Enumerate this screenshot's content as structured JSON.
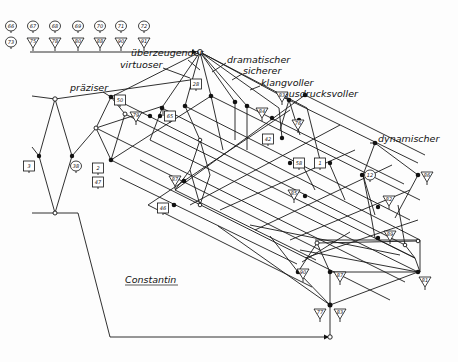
{
  "diagram": {
    "caption": "Constantin",
    "attribute_labels": [
      {
        "text": "überzeugender",
        "x": 131,
        "y": 56
      },
      {
        "text": "virtuoser",
        "x": 120,
        "y": 68
      },
      {
        "text": "präziser",
        "x": 70,
        "y": 91
      },
      {
        "text": "dramatischer",
        "x": 227,
        "y": 63
      },
      {
        "text": "sicherer",
        "x": 243,
        "y": 74
      },
      {
        "text": "klangvoller",
        "x": 261,
        "y": 86
      },
      {
        "text": "ausdrucksvoller",
        "x": 283,
        "y": 97
      },
      {
        "text": "dynamischer",
        "x": 378,
        "y": 142
      }
    ],
    "legend_row_top": [
      "66",
      "67",
      "68",
      "69",
      "70",
      "71",
      "72"
    ],
    "legend_row_bottom": [
      "73",
      "75",
      "78",
      "80",
      "88",
      "90",
      "91"
    ],
    "object_tags": [
      {
        "text": "66",
        "shape": "circle",
        "x": 11,
        "y": 26
      },
      {
        "text": "67",
        "shape": "circle",
        "x": 33,
        "y": 26
      },
      {
        "text": "68",
        "shape": "circle",
        "x": 55,
        "y": 26
      },
      {
        "text": "69",
        "shape": "circle",
        "x": 78,
        "y": 26
      },
      {
        "text": "70",
        "shape": "circle",
        "x": 100,
        "y": 26
      },
      {
        "text": "71",
        "shape": "circle",
        "x": 121,
        "y": 26
      },
      {
        "text": "72",
        "shape": "circle",
        "x": 144,
        "y": 26
      },
      {
        "text": "73",
        "shape": "circle",
        "x": 11,
        "y": 42
      },
      {
        "text": "75",
        "shape": "triangle",
        "x": 33,
        "y": 42
      },
      {
        "text": "78",
        "shape": "triangle",
        "x": 55,
        "y": 42
      },
      {
        "text": "80",
        "shape": "triangle",
        "x": 78,
        "y": 42
      },
      {
        "text": "88",
        "shape": "triangle",
        "x": 100,
        "y": 42
      },
      {
        "text": "90",
        "shape": "triangle",
        "x": 121,
        "y": 42
      },
      {
        "text": "91",
        "shape": "triangle",
        "x": 144,
        "y": 42
      },
      {
        "text": "50",
        "shape": "box",
        "x": 120,
        "y": 100
      },
      {
        "text": "28",
        "shape": "box",
        "x": 196,
        "y": 84
      },
      {
        "text": "79",
        "shape": "triangle",
        "x": 136,
        "y": 116
      },
      {
        "text": "65",
        "shape": "box",
        "x": 170,
        "y": 116
      },
      {
        "text": "83",
        "shape": "triangle",
        "x": 282,
        "y": 96
      },
      {
        "text": "84",
        "shape": "triangle",
        "x": 262,
        "y": 112
      },
      {
        "text": "76",
        "shape": "triangle",
        "x": 298,
        "y": 124
      },
      {
        "text": "42",
        "shape": "box",
        "x": 268,
        "y": 139
      },
      {
        "text": "58",
        "shape": "box",
        "x": 299,
        "y": 163
      },
      {
        "text": "1",
        "shape": "box",
        "x": 320,
        "y": 163
      },
      {
        "text": "12",
        "shape": "circle",
        "x": 370,
        "y": 175
      },
      {
        "text": "3",
        "shape": "box",
        "x": 29,
        "y": 166
      },
      {
        "text": "38",
        "shape": "circle",
        "x": 76,
        "y": 166
      },
      {
        "text": "2",
        "shape": "box",
        "x": 98,
        "y": 168
      },
      {
        "text": "47",
        "shape": "box",
        "x": 98,
        "y": 182
      },
      {
        "text": "87",
        "shape": "triangle",
        "x": 175,
        "y": 180
      },
      {
        "text": "46",
        "shape": "box",
        "x": 163,
        "y": 208
      },
      {
        "text": "85",
        "shape": "triangle",
        "x": 294,
        "y": 194
      },
      {
        "text": "82",
        "shape": "triangle",
        "x": 389,
        "y": 200
      },
      {
        "text": "86",
        "shape": "triangle",
        "x": 427,
        "y": 176
      },
      {
        "text": "89",
        "shape": "triangle",
        "x": 390,
        "y": 235
      },
      {
        "text": "81",
        "shape": "triangle",
        "x": 425,
        "y": 281
      },
      {
        "text": "90",
        "shape": "triangle",
        "x": 303,
        "y": 273
      },
      {
        "text": "87",
        "shape": "triangle",
        "x": 340,
        "y": 276
      },
      {
        "text": "77",
        "shape": "triangle",
        "x": 320,
        "y": 313
      },
      {
        "text": "83",
        "shape": "triangle",
        "x": 340,
        "y": 313
      }
    ]
  }
}
